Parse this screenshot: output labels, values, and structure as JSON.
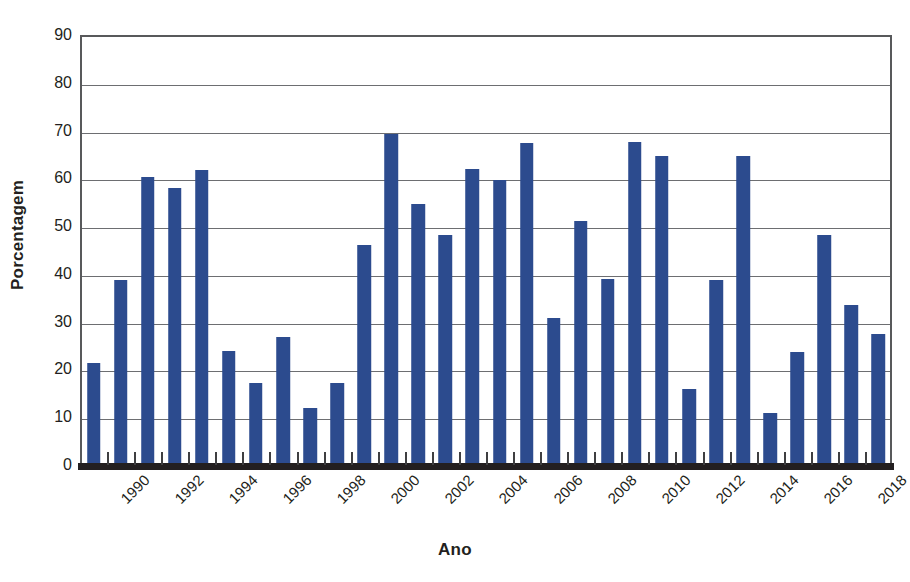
{
  "chart_data": {
    "type": "bar",
    "title": "",
    "xlabel": "Ano",
    "ylabel": "Porcentagem",
    "ylim": [
      0,
      90
    ],
    "ytick_step": 10,
    "yticks": [
      0,
      10,
      20,
      30,
      40,
      50,
      60,
      70,
      80,
      90
    ],
    "ytick_labels": [
      "0",
      "10",
      "20",
      "30",
      "40",
      "50",
      "60",
      "70",
      "80",
      "90"
    ],
    "grid": true,
    "grid_axis": "y",
    "legend": false,
    "bar_color": "#2c4b8e",
    "axis_color": "#58595b",
    "gridline_color": "#6d6e71",
    "text_color": "#231f20",
    "categories": [
      "1990",
      "1991",
      "1992",
      "1993",
      "1994",
      "1995",
      "1996",
      "1997",
      "1998",
      "1999",
      "2000",
      "2001",
      "2002",
      "2003",
      "2004",
      "2005",
      "2006",
      "2007",
      "2008",
      "2009",
      "2010",
      "2011",
      "2012",
      "2013",
      "2014",
      "2015",
      "2016",
      "2017",
      "2018",
      "2019"
    ],
    "values": [
      21.3,
      38.8,
      60.2,
      57.9,
      61.8,
      23.9,
      17.2,
      26.8,
      11.9,
      17.2,
      46.0,
      69.3,
      54.7,
      48.1,
      61.9,
      59.7,
      67.4,
      30.8,
      51.0,
      38.9,
      67.6,
      64.6,
      16.0,
      38.7,
      64.7,
      10.8,
      23.6,
      48.2,
      33.4,
      27.5
    ],
    "xtick_labels_shown": [
      "1990",
      "1992",
      "1994",
      "1996",
      "1998",
      "2000",
      "2002",
      "2004",
      "2006",
      "2008",
      "2010",
      "2012",
      "2014",
      "2016",
      "2018"
    ]
  }
}
